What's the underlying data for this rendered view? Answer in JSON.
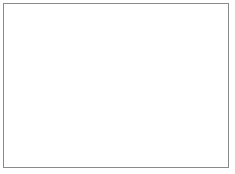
{
  "figure": {
    "caption": "",
    "background_color": "#ffffff",
    "frame": {
      "border_color": "#8a8a8a",
      "border_width": 1,
      "x": 3,
      "y": 3,
      "width": 226,
      "height": 165
    }
  },
  "specimen": {
    "name": "circular-specimen",
    "description": "pollen-grain",
    "center_x": 109,
    "center_y": 86,
    "radius_x": 43,
    "radius_y": 40,
    "rim_color": "#2b2b2b",
    "rim_thickness": 4.5,
    "body_color_outer": "#b9b9b9",
    "body_color_mid": "#c9c9c9",
    "body_color_inner": "#a9a9a9",
    "scallop_count": 34,
    "scallop_depth": 3.2,
    "ridge_color": "#4a4a4a",
    "ridge_count": 34,
    "ridge_inner_ratio": 0.8
  },
  "pores": {
    "name": "pore-cluster",
    "color": "#242424",
    "radius": 1.35,
    "halo_color": "#8e8e8e",
    "halo_radius": 2.3,
    "points": [
      [
        108,
        62
      ],
      [
        116,
        63
      ],
      [
        100,
        65
      ],
      [
        123,
        66
      ],
      [
        94,
        69
      ],
      [
        108,
        68
      ],
      [
        117,
        70
      ],
      [
        128,
        70
      ],
      [
        101,
        72
      ],
      [
        110,
        74
      ],
      [
        122,
        75
      ],
      [
        92,
        75
      ],
      [
        131,
        76
      ],
      [
        97,
        78
      ],
      [
        105,
        79
      ],
      [
        115,
        79
      ],
      [
        126,
        80
      ],
      [
        90,
        81
      ],
      [
        100,
        84
      ],
      [
        110,
        85
      ],
      [
        120,
        85
      ],
      [
        130,
        85
      ],
      [
        95,
        88
      ],
      [
        105,
        90
      ],
      [
        115,
        90
      ],
      [
        125,
        91
      ],
      [
        91,
        92
      ],
      [
        100,
        95
      ],
      [
        110,
        96
      ],
      [
        120,
        96
      ],
      [
        96,
        99
      ],
      [
        106,
        101
      ],
      [
        116,
        100
      ],
      [
        124,
        97
      ],
      [
        112,
        104
      ],
      [
        102,
        59
      ],
      [
        119,
        58
      ],
      [
        128,
        63
      ],
      [
        86,
        86
      ],
      [
        133,
        91
      ]
    ]
  },
  "speckles": {
    "name": "field-speckle",
    "color": "#b0b0b0",
    "points": [
      [
        146,
        55
      ],
      [
        151,
        120
      ],
      [
        70,
        118
      ],
      [
        72,
        52
      ],
      [
        160,
        132
      ],
      [
        58,
        62
      ],
      [
        140,
        46
      ],
      [
        78,
        130
      ]
    ]
  },
  "labels": {
    "figure_label": "",
    "scale_text": ""
  }
}
